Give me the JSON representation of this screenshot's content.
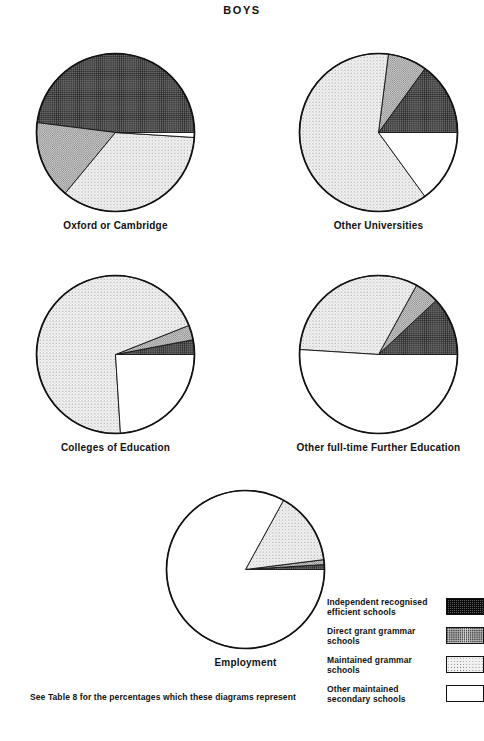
{
  "title": "BOYS",
  "footnote": "See Table 8 for the percentages which these diagrams represent",
  "legend": {
    "items": [
      {
        "label": "Independent recognised efficient schools",
        "swatch": "dark-hatch-swatch",
        "color": "#5d5d5d"
      },
      {
        "label": "Direct grant grammar schools",
        "swatch": "medium-dot-swatch",
        "color": "#d2d2d2"
      },
      {
        "label": "Maintained grammar schools",
        "swatch": "light-dot-swatch",
        "color": "#f1f1f1"
      },
      {
        "label": "Other maintained secondary schools",
        "swatch": "white-swatch",
        "color": "#ffffff"
      }
    ]
  },
  "chart_data": {
    "type": "pie",
    "title": "BOYS",
    "note": "See Table 8 for the percentages which these diagrams represent",
    "categories": [
      "Independent recognised efficient schools",
      "Direct grant grammar schools",
      "Maintained grammar schools",
      "Other maintained secondary schools"
    ],
    "category_fills": [
      "dark-hatch",
      "medium-dot",
      "light-dot",
      "white"
    ],
    "legend_position": "bottom-right",
    "charts": [
      {
        "name": "oxford-or-cambridge",
        "label": "Oxford or Cambridge",
        "values": [
          48,
          16,
          35,
          1
        ],
        "unit": "percent"
      },
      {
        "name": "other-universities",
        "label": "Other Universities",
        "values": [
          15,
          8,
          62,
          15
        ],
        "unit": "percent"
      },
      {
        "name": "colleges-of-education",
        "label": "Colleges of Education",
        "values": [
          3,
          3,
          70,
          24
        ],
        "unit": "percent"
      },
      {
        "name": "other-full-time-further-education",
        "label": "Other full-time Further Education",
        "values": [
          12,
          5,
          32,
          51
        ],
        "unit": "percent"
      },
      {
        "name": "employment",
        "label": "Employment",
        "values": [
          1,
          1,
          15,
          83
        ],
        "unit": "percent"
      }
    ]
  }
}
